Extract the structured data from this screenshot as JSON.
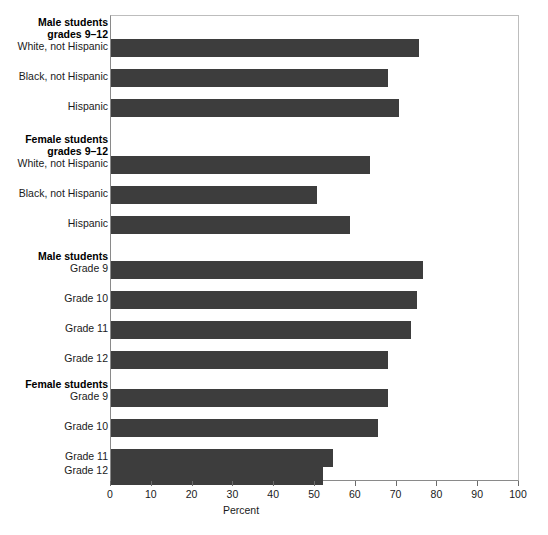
{
  "chart_data": {
    "type": "bar",
    "orientation": "horizontal",
    "title": "",
    "xlabel": "Percent",
    "ylabel": "",
    "xlim": [
      0,
      100
    ],
    "xticks": [
      0,
      10,
      20,
      30,
      40,
      50,
      60,
      70,
      80,
      90,
      100
    ],
    "xticklabels": [
      "0",
      "10",
      "20",
      "30",
      "40",
      "50",
      "60",
      "70",
      "80",
      "90",
      "100"
    ],
    "grid": false,
    "legend": "none",
    "bar_color": "#3d3d3d",
    "groups": [
      {
        "heading": [
          "Male students",
          "grades 9–12"
        ],
        "categories": [
          "White, not Hispanic",
          "Black, not Hispanic",
          "Hispanic"
        ],
        "values": [
          75.5,
          68.0,
          70.5
        ]
      },
      {
        "heading": [
          "Female students",
          "grades 9–12"
        ],
        "categories": [
          "White, not Hispanic",
          "Black, not Hispanic",
          "Hispanic"
        ],
        "values": [
          63.5,
          50.5,
          58.5
        ]
      },
      {
        "heading": [
          "Male students"
        ],
        "categories": [
          "Grade 9",
          "Grade 10",
          "Grade 11",
          "Grade 12"
        ],
        "values": [
          76.5,
          75.0,
          73.5,
          68.0
        ]
      },
      {
        "heading": [
          "Female students"
        ],
        "categories": [
          "Grade 9",
          "Grade 10",
          "Grade 11",
          "Grade 12"
        ],
        "values": [
          68.0,
          65.5,
          54.5,
          52.0
        ]
      }
    ],
    "categories": [
      "Male students grades 9-12: White, not Hispanic",
      "Male students grades 9-12: Black, not Hispanic",
      "Male students grades 9-12: Hispanic",
      "Female students grades 9-12: White, not Hispanic",
      "Female students grades 9-12: Black, not Hispanic",
      "Female students grades 9-12: Hispanic",
      "Male students: Grade 9",
      "Male students: Grade 10",
      "Male students: Grade 11",
      "Male students: Grade 12",
      "Female students: Grade 9",
      "Female students: Grade 10",
      "Female students: Grade 11",
      "Female students: Grade 12"
    ],
    "values": [
      75.5,
      68.0,
      70.5,
      63.5,
      50.5,
      58.5,
      76.5,
      75.0,
      73.5,
      68.0,
      68.0,
      65.5,
      54.5,
      52.0
    ]
  },
  "axis": {
    "x_title": "Percent"
  },
  "labels": {
    "group_male_912_line1": "Male students",
    "group_male_912_line2": "grades 9–12",
    "group_female_912_line1": "Female students",
    "group_female_912_line2": "grades 9–12",
    "group_male_grades": "Male students",
    "group_female_grades": "Female students",
    "white_not_hispanic": "White, not Hispanic",
    "black_not_hispanic": "Black, not Hispanic",
    "hispanic": "Hispanic",
    "grade_9": "Grade 9",
    "grade_10": "Grade 10",
    "grade_11": "Grade 11",
    "grade_12": "Grade 12"
  }
}
